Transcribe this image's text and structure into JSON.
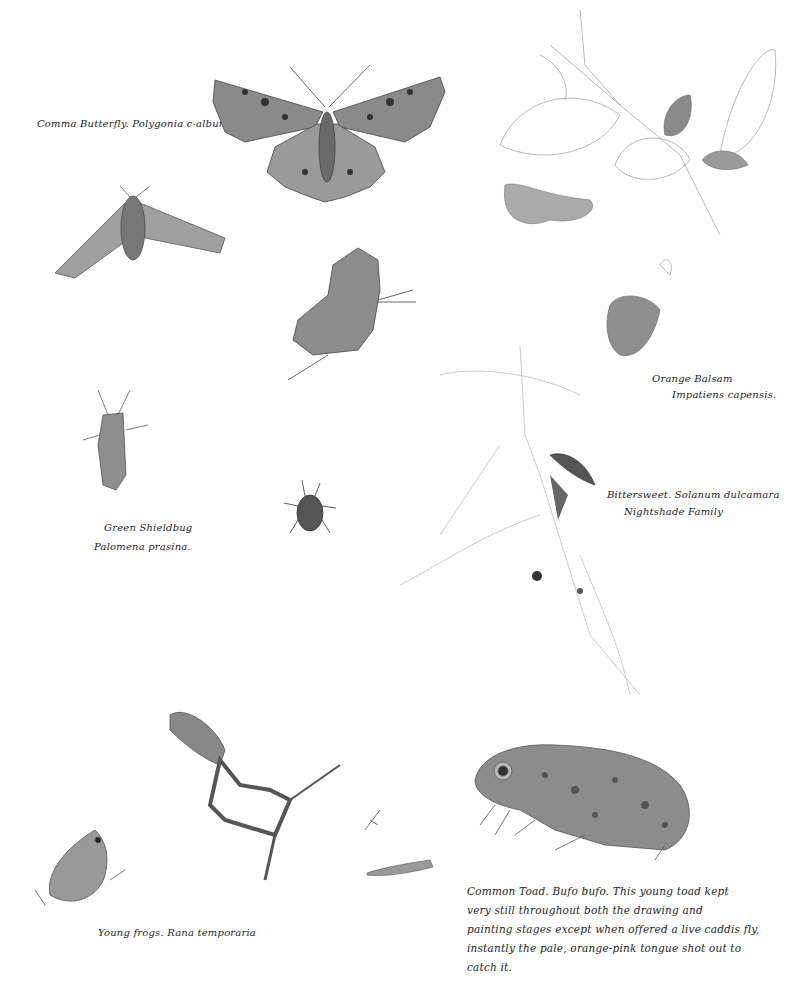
{
  "page": {
    "background": "#ffffff",
    "ink_color": "#1e1e1e",
    "pencil_color": "#9a9a9a"
  },
  "captions": {
    "comma_butterfly": "Comma Butterfly. Polygonia c-album.",
    "orange_balsam_common": "Orange Balsam",
    "orange_balsam_latin": "Impatiens capensis.",
    "bittersweet_line1": "Bittersweet. Solanum dulcamara",
    "bittersweet_line2": "Nightshade Family",
    "green_shieldbug_common": "Green Shieldbug",
    "green_shieldbug_latin": "Palomena prasina.",
    "young_frogs": "Young frogs. Rana temporaria",
    "common_toad_line1": "Common Toad. Bufo bufo. This young toad kept",
    "common_toad_line2": "very still throughout both the drawing and",
    "common_toad_line3": "painting stages except when offered a live caddis fly,",
    "common_toad_line4": "instantly the pale, orange-pink tongue shot out to",
    "common_toad_line5": "catch it."
  },
  "illustrations": [
    {
      "name": "comma-butterfly-open-wings"
    },
    {
      "name": "hawk-moth"
    },
    {
      "name": "comma-butterfly-closed-wings"
    },
    {
      "name": "small-moth"
    },
    {
      "name": "orange-balsam-plant"
    },
    {
      "name": "bittersweet-plant"
    },
    {
      "name": "green-shieldbug"
    },
    {
      "name": "ladybirds"
    },
    {
      "name": "young-frog-leaping"
    },
    {
      "name": "young-frog-sitting"
    },
    {
      "name": "caddis-larva"
    },
    {
      "name": "small-insect"
    },
    {
      "name": "common-toad"
    }
  ]
}
